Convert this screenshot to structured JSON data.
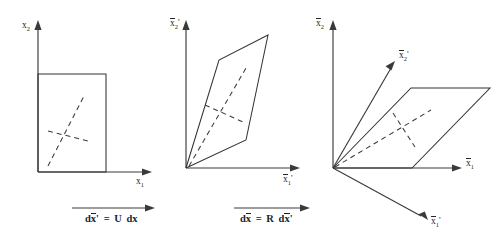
{
  "figure": {
    "background_color": "#ffffff",
    "line_color": "#333333",
    "text_color": "#262626",
    "panels": [
      {
        "id": "panel-reference",
        "axis_vertical_label": "x",
        "axis_vertical_sub": "2",
        "axis_vertical_prime": "",
        "axis_horizontal_label": "x",
        "axis_horizontal_sub": "1",
        "axis_horizontal_prime": "",
        "shape": "rectangle",
        "overbar_vertical": false,
        "overbar_horizontal": false
      },
      {
        "id": "panel-stretched",
        "axis_vertical_label": "x",
        "axis_vertical_sub": "2",
        "axis_vertical_prime": "'",
        "axis_horizontal_label": "x",
        "axis_horizontal_sub": "1",
        "axis_horizontal_prime": "'",
        "shape": "parallelogram",
        "overbar_vertical": true,
        "overbar_horizontal": true
      },
      {
        "id": "panel-rotated",
        "axis_vertical_label": "x",
        "axis_vertical_sub": "2",
        "axis_vertical_prime": "",
        "axis_horizontal_label": "x",
        "axis_horizontal_sub": "1",
        "axis_horizontal_prime": "",
        "axis_diag_up_label": "x",
        "axis_diag_up_sub": "2",
        "axis_diag_up_prime": "'",
        "axis_diag_down_label": "x",
        "axis_diag_down_sub": "1",
        "axis_diag_down_prime": "'",
        "shape": "parallelogram",
        "overbar_vertical": true,
        "overbar_horizontal": true
      }
    ],
    "captions": [
      {
        "id": "caption-stretch",
        "lhs_d": "d",
        "lhs_var": "x",
        "lhs_prime": "'",
        "equals": "=",
        "rhs_matrix": "U",
        "rhs_d": "d",
        "rhs_var": "x",
        "rhs_prime": "",
        "plain": "dx' = U dx"
      },
      {
        "id": "caption-rotate",
        "lhs_d": "d",
        "lhs_var": "x",
        "lhs_prime": "",
        "equals": "=",
        "rhs_matrix": "R",
        "rhs_d": "d",
        "rhs_var": "x",
        "rhs_prime": "'",
        "plain": "dx = R dx'"
      }
    ]
  }
}
